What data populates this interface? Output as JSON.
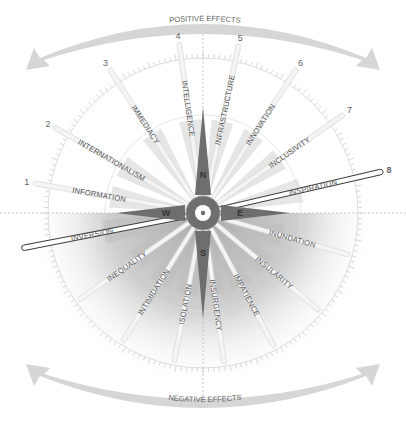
{
  "top_label": "POSITIVE EFFECTS",
  "bottom_label": "NEGATIVE EFFECTS",
  "directions": {
    "n": "N",
    "e": "E",
    "s": "S",
    "w": "W"
  },
  "positive_spokes": [
    {
      "num": "1",
      "label": "INFORMATION",
      "angle": 170
    },
    {
      "num": "2",
      "label": "INTERNATIONALISM",
      "angle": 150
    },
    {
      "num": "3",
      "label": "IMMEDIACY",
      "angle": 123
    },
    {
      "num": "4",
      "label": "INTELLIGENCE",
      "angle": 98
    },
    {
      "num": "5",
      "label": "INFRASTRUCTURE",
      "angle": 78
    },
    {
      "num": "6",
      "label": "INNOVATION",
      "angle": 57
    },
    {
      "num": "7",
      "label": "INCLUSIVITY",
      "angle": 35
    },
    {
      "num": "8",
      "label": "INSPIRATION",
      "angle": 13
    }
  ],
  "negative_spokes": [
    {
      "label": "INVERSION",
      "angle": 191
    },
    {
      "label": "INEQUALITY",
      "angle": 215
    },
    {
      "label": "INTIMIDATION",
      "angle": 238
    },
    {
      "label": "ISOLATION",
      "angle": 259
    },
    {
      "label": "INSURGENCY",
      "angle": 278
    },
    {
      "label": "IMPATIENCE",
      "angle": 298
    },
    {
      "label": "INSULARITY",
      "angle": 320
    },
    {
      "label": "INUNDATION",
      "angle": 344
    }
  ],
  "colors": {
    "compass": "#6e6e6e",
    "spoke_fill": "#f2f2f2",
    "spoke_stroke": "#d0d0d0",
    "text": "#555555",
    "shade": "#cfcfcf"
  }
}
